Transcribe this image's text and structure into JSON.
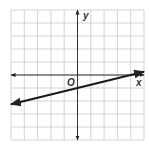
{
  "chart_data": {
    "type": "line",
    "title": "",
    "xlabel": "x",
    "ylabel": "y",
    "origin_label": "O",
    "xlim": [
      -5,
      5
    ],
    "ylim": [
      -5,
      5
    ],
    "grid": true,
    "grid_step": 1,
    "series": [
      {
        "name": "line",
        "equation": "y = x/4 - 1",
        "slope": 0.25,
        "y_intercept": -1,
        "x_intercept": 4,
        "x": [
          -5,
          5
        ],
        "y": [
          -2.25,
          0.25
        ],
        "arrows": "both"
      }
    ],
    "colors": {
      "grid": "#c8c8c8",
      "axes": "#333333",
      "line": "#1a1a1a"
    }
  },
  "labels": {
    "x_axis": "x",
    "y_axis": "y",
    "origin": "O"
  }
}
